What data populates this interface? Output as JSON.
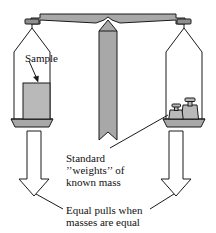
{
  "figure": {
    "type": "diagram"
  },
  "labels": {
    "sample": "Sample",
    "standard_line1": "Standard",
    "standard_line2": "’’weights’’ of",
    "standard_line3": "known mass",
    "equal_line1": "Equal pulls when",
    "equal_line2": "masses are equal"
  },
  "colors": {
    "metal_fill": "#a8a8a8",
    "metal_dark": "#8f8f8f",
    "block_fill": "#b9b9b9",
    "arrow_fill": "#ffffff",
    "stroke": "#1a1a1a",
    "text": "#111111",
    "background": "#ffffff"
  },
  "parts": {
    "beam": "balance-beam",
    "pointer": "center-pointer",
    "left_pan": "left-pan",
    "right_pan": "right-pan",
    "sample_block": "sample-block",
    "weight_small": "standard-weight-small",
    "weight_large": "standard-weight-large",
    "left_force_arrow": "left-downward-force-arrow",
    "right_force_arrow": "right-downward-force-arrow"
  }
}
